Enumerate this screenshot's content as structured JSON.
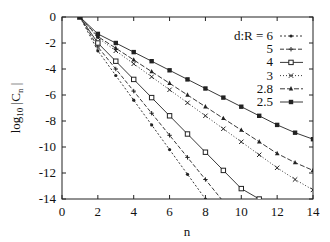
{
  "chart_data": {
    "type": "line",
    "title": "",
    "xlabel": "n",
    "ylabel": "log10 |Cn|",
    "xlim": [
      0,
      14
    ],
    "ylim": [
      -14,
      0
    ],
    "xticks": [
      0,
      2,
      4,
      6,
      8,
      10,
      12,
      14
    ],
    "yticks": [
      0,
      -2,
      -4,
      -6,
      -8,
      -10,
      -12,
      -14
    ],
    "grid": false,
    "legend_position": "top-right",
    "legend_title": "d:R =",
    "x": [
      1,
      2,
      3,
      4,
      5,
      6,
      7,
      8,
      9,
      10,
      11,
      12,
      13,
      14
    ],
    "series": [
      {
        "name": "6",
        "marker": "dot",
        "dash": "2,2",
        "values": [
          0,
          -2.6,
          -4.5,
          -6.4,
          -8.3,
          -10.2,
          -12.1,
          -14.0,
          null,
          null,
          null,
          null,
          null,
          null
        ]
      },
      {
        "name": "5",
        "marker": "plus",
        "dash": "4,2",
        "values": [
          0,
          -2.3,
          -4.0,
          -5.7,
          -7.4,
          -9.1,
          -10.8,
          -12.5,
          -14.2,
          null,
          null,
          null,
          null,
          null
        ]
      },
      {
        "name": "4",
        "marker": "square",
        "dash": "",
        "values": [
          0,
          -2.0,
          -3.4,
          -4.8,
          -6.2,
          -7.6,
          -9.0,
          -10.4,
          -11.8,
          -13.2,
          -14.0,
          null,
          null,
          null
        ]
      },
      {
        "name": "3",
        "marker": "x",
        "dash": "1,2",
        "values": [
          0,
          -1.6,
          -2.6,
          -3.6,
          -4.6,
          -5.6,
          -6.6,
          -7.6,
          -8.6,
          -9.6,
          -10.6,
          -11.6,
          -12.5,
          -13.3
        ]
      },
      {
        "name": "2.8",
        "marker": "triangle",
        "dash": "5,2",
        "values": [
          0,
          -1.5,
          -2.4,
          -3.3,
          -4.2,
          -5.1,
          -6.0,
          -6.9,
          -7.8,
          -8.7,
          -9.6,
          -10.5,
          -11.2,
          -11.8
        ]
      },
      {
        "name": "2.5",
        "marker": "filled-square",
        "dash": "",
        "values": [
          0,
          -1.3,
          -2.0,
          -2.7,
          -3.4,
          -4.1,
          -4.8,
          -5.5,
          -6.2,
          -6.9,
          -7.6,
          -8.3,
          -8.9,
          -9.4
        ]
      }
    ]
  }
}
